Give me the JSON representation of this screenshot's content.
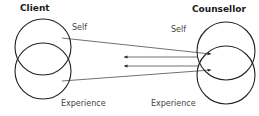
{
  "client": {
    "title": "Client",
    "self_label": "Self",
    "experience_label": "Experience"
  },
  "counsellor": {
    "title": "Counsellor",
    "self_label": "Self",
    "experience_label": "Experience"
  },
  "colors": {
    "stroke": "#222222",
    "text": "#1a1a1a",
    "label": "#444444"
  }
}
